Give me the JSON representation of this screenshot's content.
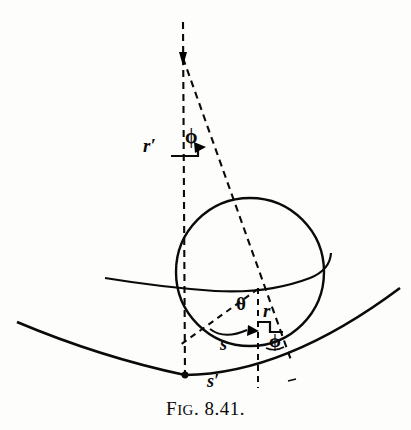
{
  "figure": {
    "caption_lead": "F",
    "caption_smallcaps": "IG",
    "caption_number": ". 8.41.",
    "caption_full": "FIG. 8.41.",
    "background_color": "#fdfdfc",
    "ink_color": "#0a0a0a"
  },
  "labels": {
    "r_prime": "r′",
    "phi_upper": "ϕ",
    "theta": "θ",
    "r": "r",
    "phi_lower": "ϕ",
    "s": "s",
    "s_prime": "s′"
  },
  "geometry": {
    "sphere": {
      "center_x": 250,
      "center_y": 272,
      "radius": 74
    },
    "apex": {
      "x": 183,
      "y": 58
    },
    "contact_point": {
      "x": 185,
      "y": 375
    },
    "equator_left_end": {
      "x": 105,
      "y": 278
    },
    "valley_curve": {
      "start_x": 17,
      "start_y": 322,
      "low_x": 185,
      "low_y": 375,
      "end_x": 400,
      "end_y": 288
    },
    "vertical_dashed_x": 184,
    "short_vertical_dashed_x": 258
  }
}
